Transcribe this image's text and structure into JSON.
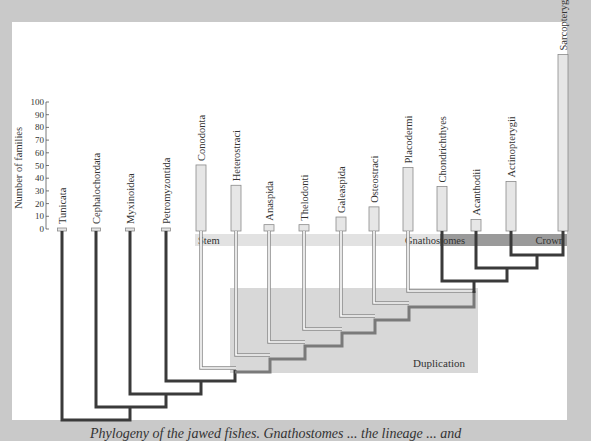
{
  "figure": {
    "y_axis": {
      "label": "Number of families",
      "ticks": [
        0,
        10,
        20,
        30,
        40,
        50,
        60,
        70,
        80,
        90,
        100
      ],
      "range": [
        0,
        100
      ]
    },
    "bands": {
      "stem_label": "Stem",
      "gnathostomes_label": "Gnathostomes",
      "crown_label": "Crown",
      "duplication_label": "Duplication"
    },
    "taxa": [
      {
        "name": "Tunicata",
        "families": 1
      },
      {
        "name": "Cephalochordata",
        "families": 1
      },
      {
        "name": "Myxinoidea",
        "families": 1
      },
      {
        "name": "Petromyzontida",
        "families": 2
      },
      {
        "name": "Conodonta",
        "families": 52
      },
      {
        "name": "Heterostraci",
        "families": 36
      },
      {
        "name": "Anaspida",
        "families": 5
      },
      {
        "name": "Thelodonti",
        "families": 5
      },
      {
        "name": "Galeaspida",
        "families": 11
      },
      {
        "name": "Osteostraci",
        "families": 19
      },
      {
        "name": "Placodermi",
        "families": 50
      },
      {
        "name": "Chondrichthyes",
        "families": 35
      },
      {
        "name": "Acanthodii",
        "families": 9
      },
      {
        "name": "Actinopterygii",
        "families": 39
      },
      {
        "name": "Sarcopterygii",
        "families": 139
      }
    ],
    "caption": "Phylogeny of the jawed fishes. Gnathostomes ... the lineage ... and"
  },
  "colors": {
    "frame": "#c9c9c9",
    "bar_fill": "#e6e6e6",
    "bar_stroke": "#8a8a8a",
    "tree_dark": "#3a3a3a",
    "tree_mid": "#7a7a7a",
    "stem_band": "#e2e2e2",
    "crown_band": "#9a9a9a",
    "duplication_box": "#d8d8d8"
  }
}
